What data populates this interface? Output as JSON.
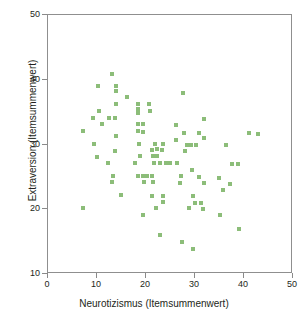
{
  "chart_data": {
    "type": "scatter",
    "title": "",
    "xlabel": "Neurotizismus (Itemsummenwert)",
    "ylabel": "Extraversion (Itemsummenwert)",
    "xlim": [
      0,
      50
    ],
    "ylim": [
      10,
      50
    ],
    "xticks": [
      0,
      10,
      20,
      30,
      40,
      50
    ],
    "yticks": [
      10,
      20,
      30,
      40,
      50
    ],
    "xtick_labels": [
      "0",
      "10",
      "20",
      "30",
      "40",
      "50"
    ],
    "ytick_labels": [
      "10",
      "20",
      "30",
      "40",
      "50"
    ],
    "grid": false,
    "legend": null,
    "marker": "square",
    "marker_color": "#8cbd79",
    "axis_color": "#8a8a8a",
    "background_color": "#ffffff",
    "points": [
      [
        13.2,
        40.8
      ],
      [
        10.3,
        39.0
      ],
      [
        14.0,
        39.0
      ],
      [
        14.0,
        38.2
      ],
      [
        27.8,
        37.9
      ],
      [
        16.2,
        37.2
      ],
      [
        14.0,
        36.2
      ],
      [
        18.5,
        36.1
      ],
      [
        20.7,
        36.2
      ],
      [
        18.6,
        35.3
      ],
      [
        18.6,
        34.8
      ],
      [
        21.0,
        35.0
      ],
      [
        10.5,
        35.1
      ],
      [
        12.6,
        34.0
      ],
      [
        13.8,
        34.0
      ],
      [
        9.2,
        33.9
      ],
      [
        32.2,
        33.8
      ],
      [
        11.1,
        33.0
      ],
      [
        18.6,
        33.1
      ],
      [
        19.6,
        33.0
      ],
      [
        26.4,
        32.9
      ],
      [
        7.1,
        31.9
      ],
      [
        13.9,
        31.2
      ],
      [
        18.6,
        31.9
      ],
      [
        19.6,
        31.8
      ],
      [
        28.0,
        31.7
      ],
      [
        31.0,
        31.6
      ],
      [
        41.4,
        31.6
      ],
      [
        43.2,
        31.5
      ],
      [
        32.2,
        30.8
      ],
      [
        26.3,
        30.6
      ],
      [
        9.4,
        30.0
      ],
      [
        18.7,
        30.0
      ],
      [
        22.1,
        30.0
      ],
      [
        23.6,
        29.9
      ],
      [
        28.5,
        29.8
      ],
      [
        29.5,
        29.8
      ],
      [
        30.4,
        29.8
      ],
      [
        36.6,
        29.7
      ],
      [
        13.8,
        28.9
      ],
      [
        21.5,
        29.0
      ],
      [
        22.5,
        29.1
      ],
      [
        23.5,
        29.0
      ],
      [
        28.2,
        28.8
      ],
      [
        10.0,
        27.9
      ],
      [
        19.0,
        28.0
      ],
      [
        21.6,
        28.0
      ],
      [
        22.5,
        28.0
      ],
      [
        12.3,
        26.9
      ],
      [
        18.0,
        27.0
      ],
      [
        21.9,
        27.0
      ],
      [
        23.0,
        26.9
      ],
      [
        24.2,
        27.0
      ],
      [
        25.2,
        26.9
      ],
      [
        26.6,
        26.9
      ],
      [
        37.9,
        26.8
      ],
      [
        39.1,
        26.8
      ],
      [
        29.6,
        25.8
      ],
      [
        13.3,
        25.0
      ],
      [
        18.6,
        25.0
      ],
      [
        19.5,
        25.0
      ],
      [
        20.4,
        25.0
      ],
      [
        21.4,
        25.0
      ],
      [
        27.4,
        24.9
      ],
      [
        31.0,
        24.8
      ],
      [
        35.2,
        24.6
      ],
      [
        13.2,
        24.0
      ],
      [
        19.7,
        24.0
      ],
      [
        21.6,
        24.0
      ],
      [
        27.2,
        23.9
      ],
      [
        32.2,
        23.8
      ],
      [
        37.4,
        23.7
      ],
      [
        36.0,
        22.7
      ],
      [
        15.0,
        22.0
      ],
      [
        21.5,
        21.9
      ],
      [
        23.6,
        21.9
      ],
      [
        29.8,
        21.8
      ],
      [
        23.7,
        20.9
      ],
      [
        30.2,
        20.8
      ],
      [
        31.4,
        20.7
      ],
      [
        7.1,
        20.0
      ],
      [
        22.3,
        20.0
      ],
      [
        29.0,
        19.9
      ],
      [
        31.8,
        19.8
      ],
      [
        35.3,
        18.8
      ],
      [
        19.6,
        18.9
      ],
      [
        39.2,
        16.7
      ],
      [
        23.0,
        15.7
      ],
      [
        27.6,
        14.6
      ],
      [
        29.9,
        13.6
      ]
    ]
  }
}
